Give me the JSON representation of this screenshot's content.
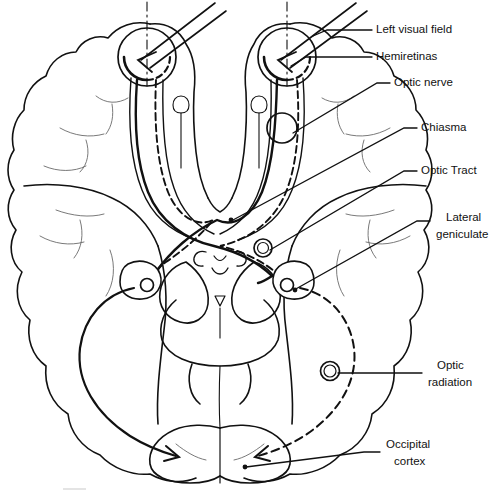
{
  "figure": {
    "type": "anatomical-line-diagram",
    "canvas": {
      "width": 500,
      "height": 495
    },
    "background_color": "#ffffff",
    "ink_color": "#000000"
  },
  "labels": [
    {
      "id": "left-visual-field",
      "text": "Left visual field",
      "x": 376,
      "y": 30
    },
    {
      "id": "hemiretinas",
      "text": "Hemiretinas",
      "x": 376,
      "y": 57
    },
    {
      "id": "optic-nerve",
      "text": "Optic nerve",
      "x": 394,
      "y": 83
    },
    {
      "id": "chiasma",
      "text": "Chiasma",
      "x": 421,
      "y": 128
    },
    {
      "id": "optic-tract",
      "text": "Optic Tract",
      "x": 421,
      "y": 171
    },
    {
      "id": "lateral-geniculate-line1",
      "text": "Lateral",
      "x": 446,
      "y": 218
    },
    {
      "id": "lateral-geniculate-line2",
      "text": "geniculate",
      "x": 436,
      "y": 235
    },
    {
      "id": "optic-radiation-line1",
      "text": "Optic",
      "x": 437,
      "y": 366
    },
    {
      "id": "optic-radiation-line2",
      "text": "radiation",
      "x": 428,
      "y": 383
    },
    {
      "id": "occipital-cortex-line1",
      "text": "Occipital",
      "x": 386,
      "y": 445
    },
    {
      "id": "occipital-cortex-line2",
      "text": "cortex",
      "x": 394,
      "y": 462
    }
  ],
  "structures": [
    {
      "id": "left-eye",
      "name": "Left eye with hemiretinas",
      "cx": 147,
      "cy": 57
    },
    {
      "id": "right-eye",
      "name": "Right eye with hemiretinas",
      "cx": 287,
      "cy": 57
    },
    {
      "id": "optic-nerve-marker",
      "name": "Optic nerve marker",
      "cx": 282,
      "cy": 128
    },
    {
      "id": "chiasma-point",
      "name": "Optic chiasma crossing",
      "cx": 213,
      "cy": 220
    },
    {
      "id": "lgn-left",
      "name": "Left lateral geniculate",
      "cx": 147,
      "cy": 283
    },
    {
      "id": "lgn-right",
      "name": "Right lateral geniculate",
      "cx": 287,
      "cy": 283
    },
    {
      "id": "optic-tract-marker",
      "name": "Optic tract marker",
      "cx": 263,
      "cy": 248
    },
    {
      "id": "optic-radiation-marker",
      "name": "Optic radiation marker",
      "cx": 330,
      "cy": 371
    },
    {
      "id": "occipital-left",
      "name": "Left occipital cortex",
      "cx": 178,
      "cy": 455
    },
    {
      "id": "occipital-right",
      "name": "Right occipital cortex",
      "cx": 262,
      "cy": 455
    }
  ],
  "legend_note": {
    "solid_pathway": "Solid line = fibers from the left hemiretinas projecting to the left occipital cortex",
    "dashed_pathway": "Dashed line = fibers from the right hemiretinas projecting to the right occipital cortex"
  }
}
